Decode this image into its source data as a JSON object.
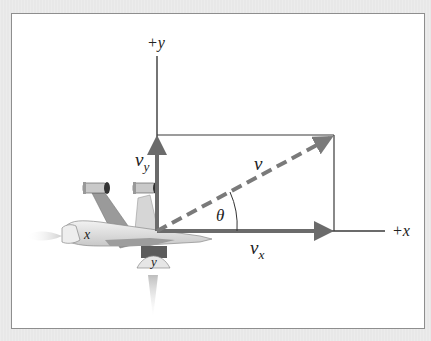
{
  "figure": {
    "axes": {
      "y_label": "+y",
      "x_label": "+x"
    },
    "vectors": {
      "v": {
        "symbol": "v",
        "style": "dashed"
      },
      "vx": {
        "symbol": "v",
        "subscript": "x"
      },
      "vy": {
        "symbol": "v",
        "subscript": "y"
      }
    },
    "angle": {
      "symbol": "θ"
    },
    "plane": {
      "rear_thruster_label": "x",
      "bottom_thruster_label": "y"
    },
    "colors": {
      "axis": "#3a3a3a",
      "component_arrow": "#6b6b6b",
      "resultant_dashed": "#7a7a7a",
      "frame_border": "#8e8e8e",
      "background": "#e9e9e9",
      "panel": "#ffffff"
    }
  }
}
